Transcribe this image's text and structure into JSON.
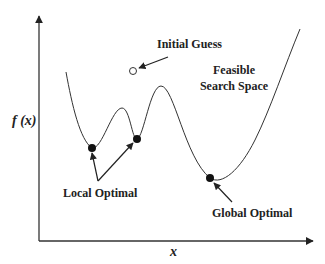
{
  "diagram": {
    "axes": {
      "y_label": "f (x)",
      "x_label": "x"
    },
    "annotations": {
      "initial_guess": "Initial Guess",
      "feasible_line1": "Feasible",
      "feasible_line2": "Search Space",
      "local_optimal": "Local Optimal",
      "global_optimal": "Global Optimal"
    },
    "colors": {
      "stroke": "#222222",
      "background": "#ffffff"
    }
  }
}
